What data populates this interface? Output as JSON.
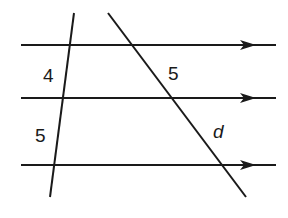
{
  "diagram": {
    "parallel_lines": [
      {
        "id": "top",
        "y": 45
      },
      {
        "id": "middle",
        "y": 98
      },
      {
        "id": "bottom",
        "y": 165
      }
    ],
    "transversals": [
      {
        "id": "left",
        "x1": 74,
        "y1": 13,
        "x2": 50,
        "y2": 197
      },
      {
        "id": "right",
        "x1": 108,
        "y1": 13,
        "x2": 246,
        "y2": 197
      }
    ],
    "labels": {
      "left_upper_segment": "4",
      "left_lower_segment": "5",
      "right_upper_segment": "5",
      "right_lower_segment": "d"
    },
    "colors": {
      "stroke": "#1a1a1a",
      "background": "#ffffff"
    }
  }
}
